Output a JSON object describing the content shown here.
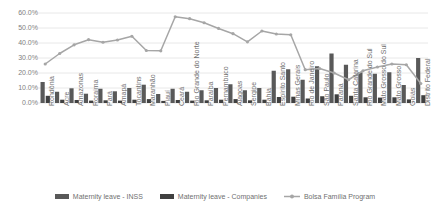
{
  "chart_data": {
    "type": "bar",
    "title": "",
    "xlabel": "",
    "ylabel": "",
    "ylim": [
      0,
      0.6
    ],
    "grid": true,
    "legend_position": "bottom",
    "y_tick_labels": [
      "60.0%",
      "50.0%",
      "40.0%",
      "30.0%",
      "20.0%",
      "10.0%",
      "0.0%"
    ],
    "y_tick_values": [
      0.6,
      0.5,
      0.4,
      0.3,
      0.2,
      0.1,
      0.0
    ],
    "categories": [
      "Rondônia",
      "Acre",
      "Amazonas",
      "Roraima",
      "Pará",
      "Amapá",
      "Tocantins",
      "Maranhão",
      "Piauí",
      "Ceará",
      "Rio Grande do Norte",
      "Paraíba",
      "Pernambuco",
      "Alagoas",
      "Sergipe",
      "Bahia",
      "Espírito Santo",
      "Minas Gerais",
      "Rio de Janeiro",
      "São Paulo",
      "Paraná",
      "Santa Catarina",
      "Rio Grande do Sul",
      "Mato Grosso do Sul",
      "Mato Grosso",
      "Goiás",
      "Distrito Federal"
    ],
    "series": [
      {
        "name": "Maternity leave - INSS",
        "type": "bar",
        "color": "#595959",
        "values": [
          0.14,
          0.075,
          0.098,
          0.062,
          0.095,
          0.078,
          0.1,
          0.122,
          0.06,
          0.095,
          0.075,
          0.085,
          0.1,
          0.125,
          0.085,
          0.1,
          0.215,
          0.225,
          0.155,
          0.245,
          0.33,
          0.255,
          0.205,
          0.195,
          0.205,
          0.12,
          0.3
        ]
      },
      {
        "name": "Maternity leave - Companies",
        "type": "bar",
        "color": "#404040",
        "values": [
          0.048,
          0.022,
          0.02,
          0.016,
          0.018,
          0.016,
          0.022,
          0.026,
          0.014,
          0.02,
          0.016,
          0.018,
          0.022,
          0.026,
          0.018,
          0.022,
          0.04,
          0.042,
          0.03,
          0.045,
          0.058,
          0.048,
          0.038,
          0.036,
          0.038,
          0.024,
          0.052
        ]
      },
      {
        "name": "Bolsa Família Program",
        "type": "line",
        "color": "#a6a6a6",
        "values": [
          0.26,
          0.33,
          0.388,
          0.422,
          0.405,
          0.42,
          0.445,
          0.35,
          0.348,
          0.575,
          0.562,
          0.535,
          0.497,
          0.462,
          0.408,
          0.48,
          0.46,
          0.455,
          0.222,
          0.23,
          0.2,
          0.155,
          0.215,
          0.24,
          0.26,
          0.255,
          0.13
        ]
      }
    ]
  },
  "legend": {
    "items": [
      {
        "label": "Maternity leave - INSS",
        "marker": "bar-swatch",
        "color": "#595959"
      },
      {
        "label": "Maternity leave - Companies",
        "marker": "bar-swatch",
        "color": "#404040"
      },
      {
        "label": "Bolsa Família Program",
        "marker": "line-marker",
        "color": "#a6a6a6"
      }
    ]
  },
  "axis": {
    "grid_color": "#e8e8e8",
    "tick_label_color": "#808080"
  }
}
